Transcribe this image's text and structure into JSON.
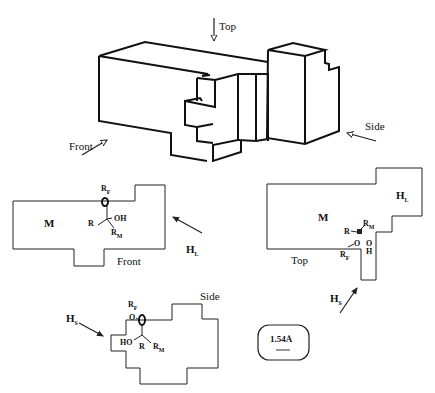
{
  "figure": {
    "block3d": {
      "view_labels": {
        "top": "Top",
        "front": "Front",
        "side": "Side"
      }
    },
    "front_view": {
      "region_label": "M",
      "view_label": "Front",
      "pocket_label": "H",
      "pocket_sub": "L",
      "substituents": {
        "rf": "R",
        "rf_sub": "F",
        "r": "R",
        "oh": "OH",
        "rm": "R",
        "rm_sub": "M"
      }
    },
    "top_view": {
      "region_label": "M",
      "view_label": "Top",
      "hl_label": "H",
      "hl_sub": "L",
      "hs_label": "H",
      "hs_sub": "S",
      "substituents": {
        "r": "R",
        "rm": "R",
        "rm_sub": "M",
        "o": "O",
        "oh_o": "O",
        "oh_h": "H",
        "rf": "R",
        "rf_sub": "F"
      }
    },
    "side_view": {
      "view_label": "Side",
      "hs_label": "H",
      "hs_sub": "S",
      "substituents": {
        "rf": "R",
        "rf_sub": "F",
        "o": "O",
        "ho": "HO",
        "r": "R",
        "rm": "R",
        "rm_sub": "M"
      }
    },
    "scale_bar": {
      "label": "1.54Å"
    }
  }
}
